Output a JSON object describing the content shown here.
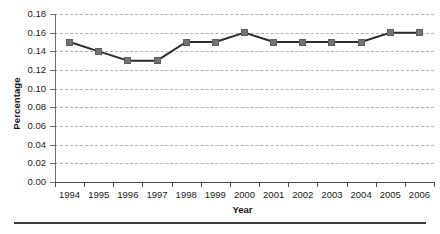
{
  "chart_data": {
    "type": "line",
    "title": "",
    "xlabel": "Year",
    "ylabel": "Percentage",
    "categories": [
      "1994",
      "1995",
      "1996",
      "1997",
      "1998",
      "1999",
      "2000",
      "2001",
      "2002",
      "2003",
      "2004",
      "2005",
      "2006"
    ],
    "values": [
      0.15,
      0.14,
      0.13,
      0.13,
      0.15,
      0.15,
      0.16,
      0.15,
      0.15,
      0.15,
      0.15,
      0.16,
      0.16
    ],
    "series": [
      {
        "name": "Percentage",
        "values": [
          0.15,
          0.14,
          0.13,
          0.13,
          0.15,
          0.15,
          0.16,
          0.15,
          0.15,
          0.15,
          0.15,
          0.16,
          0.16
        ]
      }
    ],
    "ylim": [
      0.0,
      0.18
    ],
    "ytick_step": 0.02,
    "ytick_labels": [
      "0.00",
      "0.02",
      "0.04",
      "0.06",
      "0.08",
      "0.10",
      "0.12",
      "0.14",
      "0.16",
      "0.18"
    ],
    "xtick_labels": [
      "1994",
      "1995",
      "1996",
      "1997",
      "1998",
      "1999",
      "2000",
      "2001",
      "2002",
      "2003",
      "2004",
      "2005",
      "2006"
    ],
    "grid": "horizontal-dashed",
    "legend": "none",
    "marker": "square",
    "colors": {
      "marker_fill": "#737373",
      "marker_edge": "#5e5e5e",
      "line": "#2b2b2b",
      "gridline": "#b4b4b4",
      "axis": "#4d4d4d",
      "text": "#1a1a1a"
    }
  }
}
